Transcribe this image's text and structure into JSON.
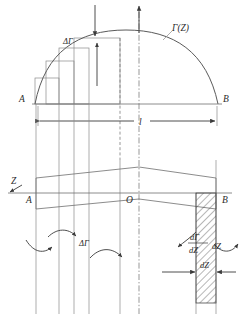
{
  "figure": {
    "type": "technical-diagram",
    "background_color": "#ffffff",
    "line_color": "#6e6e6e",
    "label_color": "#2b2b2b"
  },
  "labels": {
    "gamma_z": "Γ(Z)",
    "delta_gamma_top": "ΔΓ",
    "delta_gamma_bottom": "ΔΓ",
    "point_a_top": "A",
    "point_b_top": "B",
    "point_a_mid": "A",
    "point_b_mid": "B",
    "origin_o": "O",
    "axis_z": "Z",
    "span_l": "l",
    "dz_label": "dZ",
    "derivative_numerator": "dΓ",
    "derivative_denominator": "dZ",
    "derivative_multiplier": "dZ"
  },
  "geometry": {
    "span_left_x": 35,
    "span_right_x": 218,
    "baseline_y": 104,
    "curve_peak_y": 30,
    "axis_y": 193,
    "center_x": 126,
    "step_count": 3,
    "vortex_line_count": 6,
    "curved_arrow_count": 4
  },
  "annotations": {
    "down_arrow_top": "down-arrow",
    "up_arrow_axis": "up-arrow",
    "up_arrow_step": "up-arrow",
    "dimension_span": "double-headed-arrow",
    "dimension_dz": "double-headed-arrow"
  }
}
